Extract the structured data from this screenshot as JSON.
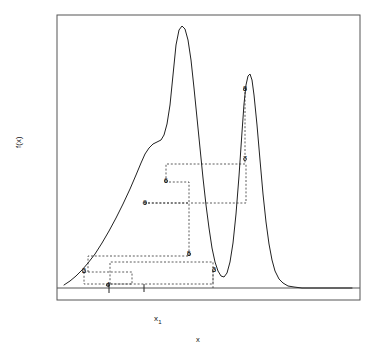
{
  "figure": {
    "axes": {
      "xlabel": "x",
      "ylabel": "f(x)",
      "x_tick_label": "x",
      "x_tick_sub": "1",
      "frame": {
        "left": 57,
        "top": 15,
        "right": 360,
        "bottom": 300
      },
      "baseline_y": 288,
      "tick_x": 144,
      "grid": false
    },
    "point_labels": [
      {
        "id": "2",
        "text": "2",
        "x": 84,
        "y": 271
      },
      {
        "id": "4",
        "text": "4",
        "x": 108,
        "y": 285
      },
      {
        "id": "9",
        "text": "9",
        "x": 145,
        "y": 203
      },
      {
        "id": "6",
        "text": "6",
        "x": 166,
        "y": 181
      },
      {
        "id": "5",
        "text": "5",
        "x": 189,
        "y": 254
      },
      {
        "id": "3",
        "text": "3",
        "x": 214,
        "y": 270
      },
      {
        "id": "7",
        "text": "7",
        "x": 245,
        "y": 159
      },
      {
        "id": "8",
        "text": "8",
        "x": 245,
        "y": 89
      }
    ]
  },
  "chart_data": {
    "type": "line",
    "title": "",
    "xlabel": "x",
    "ylabel": "f(x)",
    "grid": false,
    "legend": null,
    "xlim": [
      57,
      360
    ],
    "ylim": [
      288,
      15
    ],
    "series": [
      {
        "name": "f(x)",
        "style": "solid",
        "color": "#222222",
        "points": [
          [
            64,
            285
          ],
          [
            70,
            281
          ],
          [
            76,
            276
          ],
          [
            82,
            270
          ],
          [
            88,
            263
          ],
          [
            95,
            254
          ],
          [
            102,
            243
          ],
          [
            109,
            231
          ],
          [
            116,
            218
          ],
          [
            123,
            204
          ],
          [
            130,
            189
          ],
          [
            136,
            175
          ],
          [
            141,
            163
          ],
          [
            145,
            154
          ],
          [
            149,
            148
          ],
          [
            153,
            144
          ],
          [
            157,
            142
          ],
          [
            161,
            140
          ],
          [
            164,
            135
          ],
          [
            167,
            124
          ],
          [
            170,
            105
          ],
          [
            173,
            75
          ],
          [
            176,
            45
          ],
          [
            179,
            30
          ],
          [
            182,
            26
          ],
          [
            185,
            29
          ],
          [
            188,
            40
          ],
          [
            191,
            60
          ],
          [
            194,
            88
          ],
          [
            197,
            118
          ],
          [
            200,
            148
          ],
          [
            203,
            178
          ],
          [
            206,
            205
          ],
          [
            209,
            228
          ],
          [
            212,
            248
          ],
          [
            215,
            262
          ],
          [
            218,
            271
          ],
          [
            221,
            276
          ],
          [
            224,
            277
          ],
          [
            227,
            273
          ],
          [
            230,
            262
          ],
          [
            233,
            243
          ],
          [
            236,
            214
          ],
          [
            239,
            176
          ],
          [
            242,
            132
          ],
          [
            244,
            104
          ],
          [
            246,
            85
          ],
          [
            248,
            76
          ],
          [
            250,
            74
          ],
          [
            252,
            80
          ],
          [
            254,
            95
          ],
          [
            257,
            125
          ],
          [
            260,
            160
          ],
          [
            263,
            194
          ],
          [
            266,
            222
          ],
          [
            269,
            244
          ],
          [
            272,
            260
          ],
          [
            275,
            271
          ],
          [
            279,
            279
          ],
          [
            283,
            283
          ],
          [
            288,
            286
          ],
          [
            294,
            287
          ],
          [
            302,
            288
          ],
          [
            312,
            288
          ],
          [
            325,
            288
          ],
          [
            340,
            288
          ],
          [
            352,
            288
          ]
        ]
      }
    ],
    "annotations": [
      {
        "label": "2",
        "x": 84,
        "y": 271
      },
      {
        "label": "3",
        "x": 214,
        "y": 270
      },
      {
        "label": "4",
        "x": 108,
        "y": 285
      },
      {
        "label": "5",
        "x": 189,
        "y": 254
      },
      {
        "label": "6",
        "x": 166,
        "y": 181
      },
      {
        "label": "7",
        "x": 245,
        "y": 159
      },
      {
        "label": "8",
        "x": 245,
        "y": 89
      },
      {
        "label": "9",
        "x": 145,
        "y": 203
      }
    ],
    "construction_lines": [
      {
        "name": "box-2-4",
        "points": [
          [
            84,
            272
          ],
          [
            84,
            284
          ],
          [
            132,
            284
          ],
          [
            132,
            272
          ],
          [
            84,
            272
          ]
        ]
      },
      {
        "name": "box-5-3-4",
        "points": [
          [
            110,
            284
          ],
          [
            110,
            262
          ],
          [
            213,
            262
          ],
          [
            213,
            284
          ],
          [
            110,
            284
          ]
        ]
      },
      {
        "name": "box-5-9",
        "points": [
          [
            88,
            272
          ],
          [
            88,
            256
          ],
          [
            189,
            256
          ],
          [
            189,
            203
          ],
          [
            142,
            203
          ]
        ]
      },
      {
        "name": "line-9-6",
        "points": [
          [
            148,
            203
          ],
          [
            189,
            203
          ]
        ]
      },
      {
        "name": "box-6-7",
        "points": [
          [
            166,
            182
          ],
          [
            166,
            164
          ],
          [
            246,
            164
          ],
          [
            246,
            203
          ],
          [
            189,
            203
          ]
        ]
      },
      {
        "name": "line-6-right",
        "points": [
          [
            169,
            182
          ],
          [
            189,
            182
          ],
          [
            189,
            203
          ]
        ]
      },
      {
        "name": "vert-3-base",
        "points": [
          [
            213,
            271
          ],
          [
            213,
            288
          ]
        ]
      },
      {
        "name": "vert-8-7",
        "points": [
          [
            245,
            92
          ],
          [
            245,
            163
          ]
        ]
      },
      {
        "name": "tick-x1",
        "points": [
          [
            144,
            284
          ],
          [
            144,
            292
          ]
        ]
      },
      {
        "name": "tick-4",
        "points": [
          [
            109,
            283
          ],
          [
            109,
            293
          ]
        ]
      }
    ]
  }
}
